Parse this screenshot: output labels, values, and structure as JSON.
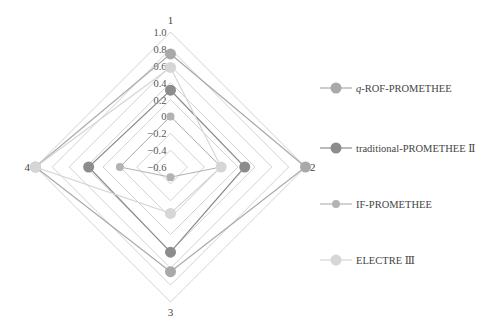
{
  "chart_data": {
    "type": "radar",
    "title": "",
    "axes": [
      "1",
      "2",
      "3",
      "4"
    ],
    "range": [
      -0.6,
      1.0
    ],
    "ticks": [
      "1.0",
      "0.8",
      "0.6",
      "0.4",
      "0.2",
      "0",
      "−0.2",
      "−0.4",
      "−0.6"
    ],
    "tick_values": [
      1.0,
      0.8,
      0.6,
      0.4,
      0.2,
      0.0,
      -0.2,
      -0.4,
      -0.6
    ],
    "grid": true,
    "legend_position": "right",
    "series": [
      {
        "name": "q-ROF-PROMETHEE",
        "name_prefix_italic": "q",
        "name_rest": "-ROF-PROMETHEE",
        "values": [
          0.74,
          1.0,
          0.64,
          1.0
        ],
        "color": "#a9a9a9",
        "marker_radius": 5.5,
        "line_width": 1.2
      },
      {
        "name": "traditional-PROMETHEE Ⅱ",
        "name_prefix_italic": "",
        "name_rest": "traditional-PROMETHEE Ⅱ",
        "values": [
          0.31,
          0.28,
          0.41,
          0.37
        ],
        "color": "#8c8c8c",
        "marker_radius": 5.5,
        "line_width": 1.2
      },
      {
        "name": "IF-PROMETHEE",
        "name_prefix_italic": "",
        "name_rest": "IF-PROMETHEE",
        "values": [
          0.0,
          0.0,
          -0.48,
          0.0
        ],
        "color": "#b3b3b3",
        "marker_radius": 4,
        "line_width": 1.0
      },
      {
        "name": "ELECTRE Ⅲ",
        "name_prefix_italic": "",
        "name_rest": "ELECTRE  Ⅲ",
        "values": [
          0.58,
          0.0,
          -0.05,
          1.0
        ],
        "color": "#d6d6d6",
        "marker_radius": 5.5,
        "line_width": 1.2
      }
    ]
  },
  "colors": {
    "grid": "#d2d2d2",
    "background": "#ffffff"
  }
}
